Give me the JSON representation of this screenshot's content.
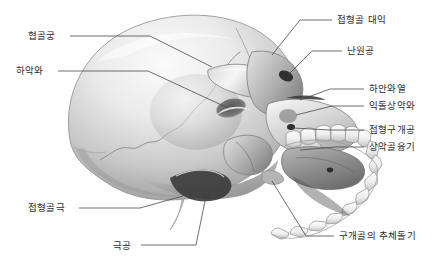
{
  "figure": {
    "view": "skull-inferolateral-oblique",
    "background_color": "#ffffff",
    "line_color": "#4a4a4a",
    "text_color": "#2b2b2b",
    "width": 443,
    "height": 274
  },
  "labels": [
    {
      "id": "zygomatic-arch",
      "text": "협골궁",
      "side": "left",
      "x": 28,
      "y": 31,
      "leader": "M 70 36 L 150 36 L 212 67"
    },
    {
      "id": "mandibular-fossa",
      "text": "하악와",
      "side": "left",
      "x": 16,
      "y": 66,
      "leader": "M 58 71 L 148 71 L 228 108"
    },
    {
      "id": "sphenoid-spine",
      "text": "접형골극",
      "side": "left",
      "x": 28,
      "y": 203,
      "leader": "M 79 208 L 140 208 L 183 196"
    },
    {
      "id": "foramen-spinosum",
      "text": "극공",
      "side": "left",
      "x": 113,
      "y": 241,
      "leader": "M 141 245 L 196 245 L 206 196"
    },
    {
      "id": "sphenoid-greater-wing",
      "text": "접형골 대익",
      "side": "right",
      "x": 337,
      "y": 15,
      "leader": "M 332 20 L 300 20 L 272 55"
    },
    {
      "id": "foramen-ovale",
      "text": "난원공",
      "side": "right",
      "x": 347,
      "y": 46,
      "leader": "M 342 51 L 312 51 L 288 75"
    },
    {
      "id": "inferior-orbital-fissure",
      "text": "하안와열",
      "side": "right",
      "x": 369,
      "y": 84,
      "leader": "M 364 89 L 330 89 L 300 100"
    },
    {
      "id": "pterygomaxillary-fossa",
      "text": "익돌상악와",
      "side": "right",
      "x": 369,
      "y": 101,
      "leader": "M 364 106 L 332 106 L 296 115"
    },
    {
      "id": "sphenopalatine-foramen",
      "text": "접형구개공",
      "side": "right",
      "x": 369,
      "y": 125,
      "leader": "M 364 130 L 330 130 L 293 128"
    },
    {
      "id": "maxillary-tuberosity",
      "text": "상악골융기",
      "side": "right",
      "x": 369,
      "y": 142,
      "leader": "M 364 147 L 336 147 L 300 150"
    },
    {
      "id": "palatine-pyramidal-process",
      "text": "구개골의 추체돌기",
      "side": "right",
      "x": 339,
      "y": 231,
      "leader": "M 334 236 L 306 236 L 272 181"
    }
  ]
}
